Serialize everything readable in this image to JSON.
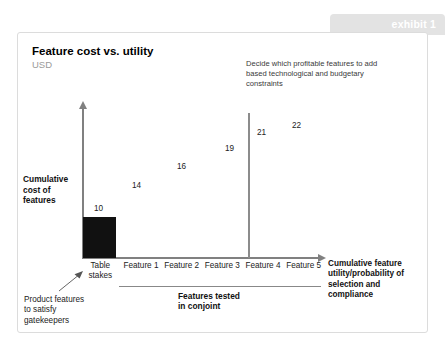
{
  "exhibit": {
    "banner_label": "exhibit 1",
    "banner_color": "#e3e3e3"
  },
  "chart": {
    "title": "Feature cost vs. utility",
    "subtitle": "USD",
    "y_axis_label": "Cumulative cost of features",
    "x_axis_label": "Cumulative feature utility/probability of selection and compliance",
    "annotation_top": "Decide which profitable features to add based technological and budgetary constraints",
    "bracket_label": "Features tested in conjoint",
    "callout_gatekeepers": "Product features to satisfy gatekeepers",
    "bar_color": "#111111",
    "axis_color": "#808080",
    "threshold_color": "#8c8c8c"
  },
  "chart_data": {
    "type": "bar",
    "title": "Feature cost vs. utility",
    "subtitle": "USD",
    "xlabel": "Cumulative feature utility/probability of selection and compliance",
    "ylabel": "Cumulative cost of features",
    "categories": [
      "Table stakes",
      "Feature 1",
      "Feature 2",
      "Feature 3",
      "Feature 4",
      "Feature 5"
    ],
    "values": [
      10,
      14,
      16,
      19,
      21,
      22
    ],
    "value_labels": [
      "10",
      "14",
      "16",
      "19",
      "21",
      "22"
    ],
    "rendered_bars": [
      "Table stakes"
    ],
    "ylim": [
      0,
      24
    ],
    "grid": false,
    "legend": "none",
    "annotations": [
      {
        "text": "Decide which profitable features to add based technological and budgetary constraints",
        "target": "threshold line after Feature 3"
      },
      {
        "text": "Product features to satisfy gatekeepers",
        "target": "Table stakes"
      },
      {
        "text": "Features tested in conjoint",
        "target": "Feature 1 through Feature 5"
      }
    ],
    "threshold": {
      "after_category": "Feature 3",
      "label": "budget / technology constraint"
    }
  },
  "x_ticks": [
    {
      "label_line1": "Table",
      "label_line2": "stakes"
    },
    {
      "label_line1": "Feature 1",
      "label_line2": ""
    },
    {
      "label_line1": "Feature 2",
      "label_line2": ""
    },
    {
      "label_line1": "Feature 3",
      "label_line2": ""
    },
    {
      "label_line1": "Feature 4",
      "label_line2": ""
    },
    {
      "label_line1": "Feature 5",
      "label_line2": ""
    }
  ],
  "data_labels": [
    {
      "value": "10",
      "left": 76,
      "top": 171
    },
    {
      "value": "14",
      "left": 114,
      "top": 148
    },
    {
      "value": "16",
      "left": 159,
      "top": 129
    },
    {
      "value": "19",
      "left": 207,
      "top": 111
    },
    {
      "value": "21",
      "left": 239,
      "top": 95
    },
    {
      "value": "22",
      "left": 274,
      "top": 88
    }
  ]
}
